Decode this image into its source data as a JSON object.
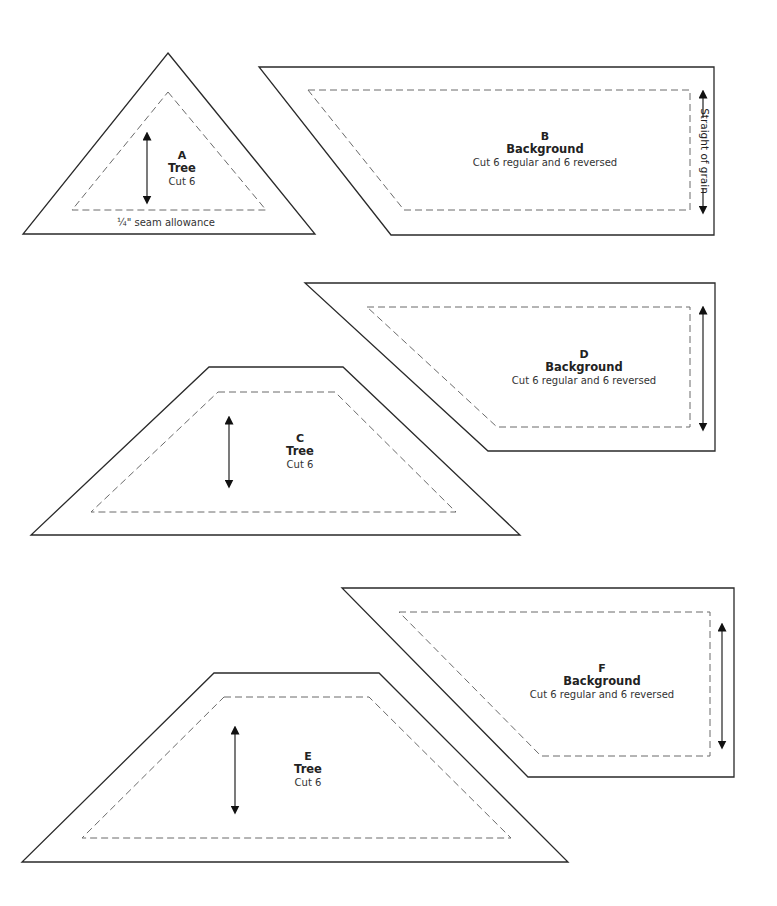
{
  "pieces": {
    "A": {
      "letter": "A",
      "fabric": "Tree",
      "cut": "Cut 6",
      "seam_note": "¼\" seam allowance"
    },
    "B": {
      "letter": "B",
      "fabric": "Background",
      "cut": "Cut 6 regular and 6 reversed",
      "grain_note": "Straight of grain"
    },
    "C": {
      "letter": "C",
      "fabric": "Tree",
      "cut": "Cut 6"
    },
    "D": {
      "letter": "D",
      "fabric": "Background",
      "cut": "Cut 6 regular and 6 reversed"
    },
    "E": {
      "letter": "E",
      "fabric": "Tree",
      "cut": "Cut 6"
    },
    "F": {
      "letter": "F",
      "fabric": "Background",
      "cut": "Cut 6 regular and 6 reversed"
    }
  },
  "colors": {
    "outline": "#2a2a2a",
    "seam_line": "#6a6a6a",
    "background": "#ffffff"
  }
}
